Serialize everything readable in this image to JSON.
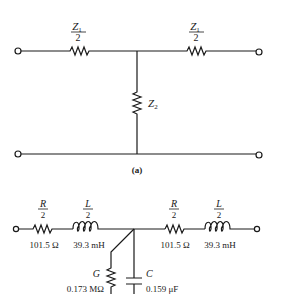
{
  "figure_a": {
    "caption": "(a)",
    "series_left": {
      "num": "Z",
      "sub": "1",
      "den": "2"
    },
    "series_right": {
      "num": "Z",
      "sub": "1",
      "den": "2"
    },
    "shunt": {
      "name": "Z",
      "sub": "2"
    }
  },
  "figure_b": {
    "left_R": {
      "num": "R",
      "den": "2",
      "value": "101.5 Ω"
    },
    "left_L": {
      "num": "L",
      "den": "2",
      "value": "39.3 mH"
    },
    "right_R": {
      "num": "R",
      "den": "2",
      "value": "101.5 Ω"
    },
    "right_L": {
      "num": "L",
      "den": "2",
      "value": "39.3 mH"
    },
    "shunt_G": {
      "name": "G",
      "value": "0.173 MΩ"
    },
    "shunt_C": {
      "name": "C",
      "value": "0.159 μF"
    }
  },
  "colors": {
    "ink": "#1a1a1a",
    "background": "#ffffff"
  }
}
